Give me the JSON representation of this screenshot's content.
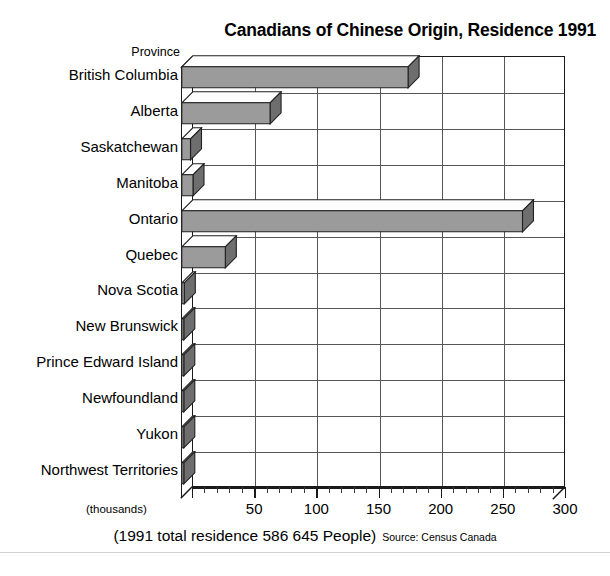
{
  "chart_data": {
    "type": "bar",
    "orientation": "horizontal",
    "title": "Canadians of Chinese Origin, Residence 1991",
    "xlabel": "(thousands)",
    "ylabel": "Province",
    "categories": [
      "British Columbia",
      "Alberta",
      "Saskatchewan",
      "Manitoba",
      "Ontario",
      "Quebec",
      "Nova Scotia",
      "New Brunswick",
      "Prince Edward Island",
      "Newfoundland",
      "Yukon",
      "Northwest Territories"
    ],
    "values": [
      182,
      71,
      7,
      9,
      274,
      35,
      2,
      1,
      0.3,
      0.5,
      0.3,
      0.3
    ],
    "units": "thousands",
    "xlim": [
      0,
      300
    ],
    "xticks": [
      0,
      50,
      100,
      150,
      200,
      250,
      300
    ],
    "xtick_labels": [
      "",
      "50",
      "100",
      "150",
      "200",
      "250",
      "300"
    ],
    "minor_tick_step": 10,
    "grid": "vertical and horizontal",
    "legend": "none",
    "style3d": true,
    "bar_fill": "#9b9b9b",
    "bar_top_fill": "#fdfdfd",
    "bar_side_fill": "#6e6e6e",
    "bar_edge": "#202020",
    "frame_color": "#1a1a1a",
    "grid_color": "#565656",
    "annotations": {
      "footer_main": "(1991 total residence 586 645 People)",
      "footer_source": "Source: Census Canada"
    }
  },
  "title": "Canadians of Chinese Origin, Residence 1991",
  "y_axis": {
    "title": "Province",
    "labels": [
      "British Columbia",
      "Alberta",
      "Saskatchewan",
      "Manitoba",
      "Ontario",
      "Quebec",
      "Nova Scotia",
      "New Brunswick",
      "Prince Edward Island",
      "Newfoundland",
      "Yukon",
      "Northwest Territories"
    ]
  },
  "x_axis": {
    "unit_label": "(thousands)",
    "tick_labels": [
      "50",
      "100",
      "150",
      "200",
      "250",
      "300"
    ]
  },
  "footer": {
    "main": "(1991 total residence 586 645 People)",
    "source": "Source: Census Canada"
  }
}
